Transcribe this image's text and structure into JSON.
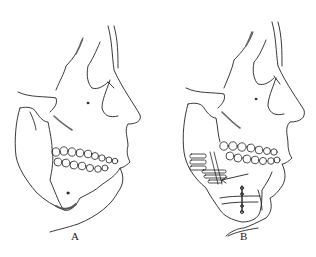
{
  "figure": {
    "panels": [
      {
        "id": "A",
        "label": "A",
        "description": "Lateral skull profile with mandibular prognathism (pre-operative)"
      },
      {
        "id": "B",
        "label": "B",
        "description": "Lateral skull profile after mandibular osteotomy with plate fixation and genioplasty (post-operative)"
      }
    ],
    "colors": {
      "line": "#222222",
      "shade": "#888888",
      "background": "#ffffff"
    }
  }
}
